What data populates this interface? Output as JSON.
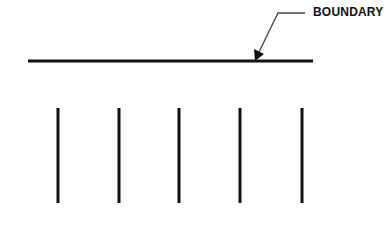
{
  "diagram": {
    "callout": {
      "label": "BOUNDARY",
      "label_pos": [
        313,
        6
      ],
      "leader_points": [
        [
          305,
          13
        ],
        [
          278,
          13
        ],
        [
          256,
          59
        ]
      ],
      "arrow_tip": [
        256,
        60
      ]
    },
    "boundary_line": {
      "x1": 28,
      "x2": 313,
      "y": 61,
      "stroke": "#111111",
      "width": 3
    },
    "vertical_lines": {
      "xs": [
        58,
        119,
        179,
        240,
        302
      ],
      "y1": 108,
      "y2": 203,
      "stroke": "#111111",
      "width": 3
    },
    "colors": {
      "line": "#111111",
      "leader": "#444444",
      "background": "#ffffff"
    }
  }
}
